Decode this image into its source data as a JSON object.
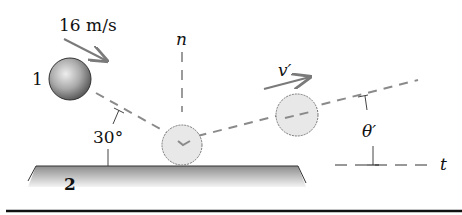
{
  "diagram": {
    "type": "oblique-impact",
    "labels": {
      "initial_speed": "16 m/s",
      "ball_1": "1",
      "plate_2": "2",
      "normal_axis": "n",
      "tangent_axis": "t",
      "incident_angle": "30°",
      "rebound_velocity": "v′",
      "rebound_angle": "θ′"
    },
    "colors": {
      "ball_dark": "#555555",
      "ball_light": "#e6e6e6",
      "ghost_ball": "#e8e8e8",
      "dashed_line": "#8a8a8a",
      "arrow": "#7a7a7a",
      "plate_top": "#8c8c8c",
      "plate_bottom": "#f2f2f2",
      "rule": "#111111"
    }
  }
}
